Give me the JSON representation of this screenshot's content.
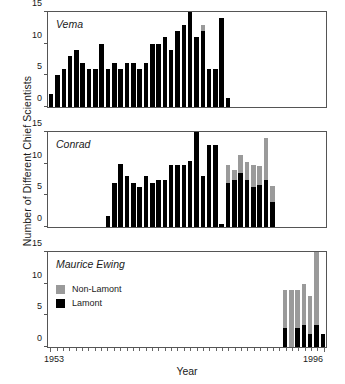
{
  "chart_data": {
    "type": "bar",
    "title": "",
    "xlabel": "Year",
    "ylabel": "Number of Different Chief Scientists",
    "xlim": [
      1953,
      1996
    ],
    "ylim": [
      0,
      15
    ],
    "yticks": [
      0,
      5,
      10,
      15
    ],
    "ytick_labels": [
      "0",
      "5",
      "10",
      "15"
    ],
    "x_start_label": "1953",
    "x_end_label": "1996",
    "grid": false,
    "stacked": true,
    "legend_position": "inside-bottom-panel",
    "legend": [
      {
        "key": "non_lamont",
        "label": "Non-Lamont",
        "color": "#9a9a9a"
      },
      {
        "key": "lamont",
        "label": "Lamont",
        "color": "#000000"
      }
    ],
    "panels": [
      {
        "name": "vema",
        "label": "Vema",
        "years": [
          1953,
          1954,
          1955,
          1956,
          1957,
          1958,
          1959,
          1960,
          1961,
          1962,
          1963,
          1964,
          1965,
          1966,
          1967,
          1968,
          1969,
          1970,
          1971,
          1972,
          1973,
          1974,
          1975,
          1976,
          1977,
          1978,
          1979,
          1980,
          1981
        ],
        "series": [
          {
            "name": "Lamont",
            "values": [
              2,
              5,
              6,
              8,
              9,
              7,
              6,
              6,
              10,
              6,
              7,
              6,
              7,
              7,
              6,
              7,
              10,
              10,
              11,
              9,
              12,
              13,
              15,
              11,
              12,
              6,
              6,
              14,
              1.5
            ]
          },
          {
            "name": "Non-Lamont",
            "values": [
              0,
              0,
              0,
              0,
              0,
              0,
              0,
              0,
              0,
              0,
              0,
              0,
              0,
              0,
              0,
              0,
              0,
              0,
              0,
              0,
              0,
              0,
              0,
              0,
              1,
              0,
              0,
              0,
              0
            ]
          }
        ]
      },
      {
        "name": "conrad",
        "label": "Conrad",
        "years": [
          1962,
          1963,
          1964,
          1965,
          1966,
          1967,
          1968,
          1969,
          1970,
          1971,
          1972,
          1973,
          1974,
          1975,
          1976,
          1977,
          1978,
          1979,
          1980,
          1981,
          1982,
          1983,
          1984,
          1985,
          1986,
          1987,
          1988,
          1989
        ],
        "series": [
          {
            "name": "Lamont",
            "values": [
              1.8,
              7,
              10,
              8,
              7,
              6.3,
              8,
              7,
              7.5,
              7.5,
              9.8,
              9.8,
              9.8,
              10.5,
              15,
              8,
              13,
              13,
              0.5,
              7,
              7.5,
              8.5,
              7.5,
              6.3,
              6.7,
              7.5,
              4,
              0
            ]
          },
          {
            "name": "Non-Lamont",
            "values": [
              0,
              0,
              0,
              0,
              0,
              0,
              0,
              0,
              0,
              0,
              0,
              0,
              0,
              0,
              0,
              0,
              0,
              0,
              0,
              2.8,
              1.5,
              2.8,
              2.8,
              3.5,
              3,
              6.5,
              2.5,
              0
            ]
          }
        ]
      },
      {
        "name": "ewing",
        "label": "Maurice Ewing",
        "years": [
          1990,
          1991,
          1992,
          1993,
          1994,
          1995,
          1996
        ],
        "series": [
          {
            "name": "Lamont",
            "values": [
              3,
              0,
              3,
              3.5,
              2,
              3.5,
              2
            ]
          },
          {
            "name": "Non-Lamont",
            "values": [
              6,
              9,
              6,
              6.5,
              6,
              11.5,
              0
            ]
          }
        ]
      }
    ]
  }
}
